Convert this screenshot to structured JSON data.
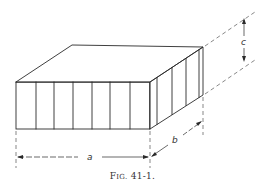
{
  "figure": {
    "caption_prefix": "F",
    "caption_small": "IG.",
    "caption_number": "41-1."
  },
  "dimensions": {
    "a": "a",
    "b": "b",
    "c": "c"
  },
  "colors": {
    "line": "#2a2a2a",
    "dashed": "#555555",
    "background": "#ffffff"
  }
}
